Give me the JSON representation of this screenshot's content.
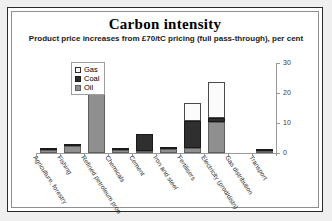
{
  "slide": {
    "title": "Carbon intensity",
    "subtitle": "Product price increases from £70/tC pricing (full pass-through), per cent"
  },
  "legend": {
    "position": "top-left-inside",
    "items": [
      {
        "label": "Gas",
        "color": "#ffffff"
      },
      {
        "label": "Coal",
        "color": "#2f2f2f"
      },
      {
        "label": "Oil",
        "color": "#8f8f8f"
      }
    ]
  },
  "axis": {
    "y_ticks": [
      "0",
      "10",
      "20",
      "30"
    ],
    "y_min": 0,
    "y_max": 30
  },
  "chart_data": {
    "type": "bar",
    "stacked": true,
    "title": "Carbon intensity",
    "subtitle": "Product price increases from £70/tC pricing (full pass-through), per cent",
    "xlabel": "",
    "ylabel": "",
    "ylim": [
      0,
      30
    ],
    "yticks": [
      0,
      10,
      20,
      30
    ],
    "grid": false,
    "legend_position": "top-left-inside",
    "categories": [
      "Agriculture, forestry",
      "Fishing",
      "Refined petroleum prod",
      "Chemicals",
      "Cement",
      "Iron and steel",
      "Fertilisers",
      "Electricity (prod/distn)",
      "Gas distribution",
      "Transport"
    ],
    "series": [
      {
        "name": "Oil",
        "color": "#8f8f8f",
        "values": [
          0.9,
          2.2,
          21.5,
          0.9,
          0.6,
          1.2,
          1.8,
          10.2,
          0.0,
          0.8
        ]
      },
      {
        "name": "Coal",
        "color": "#2f2f2f",
        "values": [
          0.3,
          0.5,
          0.6,
          0.3,
          5.8,
          0.4,
          9.0,
          1.6,
          0.0,
          0.2
        ]
      },
      {
        "name": "Gas",
        "color": "#ffffff",
        "values": [
          0.0,
          0.0,
          0.0,
          0.0,
          0.0,
          0.0,
          5.8,
          12.0,
          0.0,
          0.0
        ]
      }
    ],
    "totals": [
      1.2,
      2.7,
      22.1,
      1.2,
      6.4,
      1.6,
      16.6,
      23.8,
      0.0,
      1.0
    ]
  }
}
